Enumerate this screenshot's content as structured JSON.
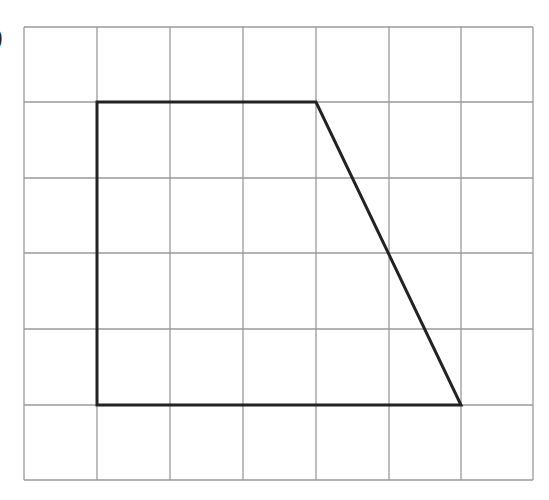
{
  "figure": {
    "label": ")",
    "grid": {
      "columns": 7,
      "rows": 6,
      "x_lines": [
        24,
        97,
        170,
        243,
        316,
        389,
        461,
        533
      ],
      "y_lines": [
        27,
        102,
        178,
        253,
        329,
        405,
        480
      ],
      "line_color": "#9a9a9a"
    },
    "shape": {
      "type": "trapezium",
      "grid_vertices": [
        [
          1,
          1
        ],
        [
          4,
          1
        ],
        [
          6,
          5
        ],
        [
          1,
          5
        ]
      ],
      "stroke_color": "#222222",
      "stroke_width": 3
    }
  }
}
